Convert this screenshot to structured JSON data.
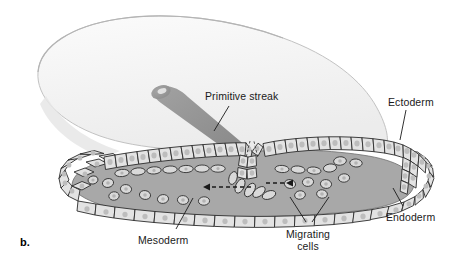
{
  "figure": {
    "panel_letter": "b.",
    "labels": [
      {
        "id": "primitive-streak",
        "text": "Primitive streak",
        "x": 205,
        "y": 90,
        "leader": [
          [
            229,
            106
          ],
          [
            214,
            131
          ]
        ]
      },
      {
        "id": "ectoderm",
        "text": "Ectoderm",
        "x": 388,
        "y": 96,
        "leader": [
          [
            406,
            110
          ],
          [
            400,
            140
          ]
        ]
      },
      {
        "id": "endoderm",
        "text": "Endoderm",
        "x": 386,
        "y": 211,
        "leader": [
          [
            403,
            206
          ],
          [
            393,
            188
          ]
        ]
      },
      {
        "id": "mesoderm",
        "text": "Mesoderm",
        "x": 138,
        "y": 234,
        "leader": [
          [
            176,
            229
          ],
          [
            193,
            198
          ]
        ]
      },
      {
        "id": "migrating-cells",
        "text": "Migrating",
        "text2": "cells",
        "x": 292,
        "y": 228,
        "leader": [
          [
            306,
            222
          ],
          [
            290,
            197
          ]
        ],
        "leader2": [
          [
            312,
            222
          ],
          [
            329,
            197
          ]
        ]
      }
    ],
    "arrows": [
      {
        "id": "arrow-left",
        "direction": "left",
        "from": [
          251,
          187
        ],
        "to": [
          197,
          187
        ],
        "style": "dashed"
      },
      {
        "id": "arrow-right",
        "direction": "right",
        "from": [
          266,
          183
        ],
        "to": [
          291,
          183
        ],
        "style": "dashed"
      }
    ],
    "colors": {
      "disc_surface": "#f2f2f2",
      "disc_edge": "#b9b9b9",
      "streak": "#8d8d8d",
      "mesoderm_fill": "#a8a8a8",
      "cell_fill": "#e3e3e3",
      "cell_stroke": "#2b2b2b",
      "nucleus": "#bdbdbd",
      "label_text": "#1a1a1a"
    },
    "structures": [
      {
        "name": "embryonic-disc",
        "description": "pale elliptical blastoderm surface seen in perspective"
      },
      {
        "name": "primitive-streak-band",
        "description": "gray tapered stripe running from upper-left to the sectioned groove"
      },
      {
        "name": "ectoderm-layer",
        "description": "upper layer of columnar epithelial cells"
      },
      {
        "name": "endoderm-layer",
        "description": "lower layer of flattened epithelial cells"
      },
      {
        "name": "mesoderm-space",
        "description": "gray interior region between ectoderm and endoderm containing loose cells"
      },
      {
        "name": "primitive-groove",
        "description": "V-shaped invagination of the ectoderm at the streak"
      }
    ]
  }
}
